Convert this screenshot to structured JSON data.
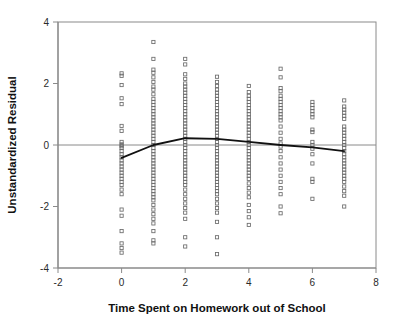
{
  "chart_data": {
    "type": "scatter",
    "title": "",
    "xlabel": "Time Spent on Homework out of School",
    "ylabel": "Unstandardized Residual",
    "xlim": [
      -2,
      8
    ],
    "ylim": [
      -4,
      4
    ],
    "xticks": [
      -2,
      0,
      2,
      4,
      6,
      8
    ],
    "yticks": [
      -4,
      -2,
      0,
      2,
      4
    ],
    "xtick_labels": [
      "-2",
      "0",
      "2",
      "4",
      "6",
      "8"
    ],
    "ytick_labels": [
      "-4",
      "-2",
      "0",
      "2",
      "4"
    ],
    "grid": false,
    "legend": null,
    "marker": "open-square",
    "marker_color": "#666666",
    "reference_line_y": 0,
    "trend_line": {
      "name": "fit line",
      "color": "#111111",
      "x": [
        0,
        1,
        2,
        3,
        4,
        5,
        6,
        7
      ],
      "y": [
        -0.42,
        0.0,
        0.22,
        0.2,
        0.1,
        0.0,
        -0.08,
        -0.2
      ]
    },
    "series": [
      {
        "name": "Unstandardized Residual",
        "x_categories": [
          0,
          1,
          2,
          3,
          4,
          5,
          6,
          7
        ],
        "points_by_x": {
          "0": [
            2.33,
            2.25,
            1.95,
            1.52,
            1.33,
            0.62,
            0.46,
            0.1,
            0.02,
            -0.04,
            -0.1,
            -0.2,
            -0.3,
            -0.4,
            -0.5,
            -0.6,
            -0.7,
            -0.8,
            -0.9,
            -1.0,
            -1.1,
            -1.2,
            -1.3,
            -1.45,
            -1.6,
            -2.1,
            -2.3,
            -2.8,
            -3.2,
            -3.35,
            -3.5
          ],
          "1": [
            3.35,
            2.8,
            2.45,
            2.35,
            2.2,
            2.05,
            1.9,
            1.8,
            1.65,
            1.5,
            1.4,
            1.3,
            1.2,
            1.1,
            1.0,
            0.9,
            0.8,
            0.7,
            0.6,
            0.5,
            0.4,
            0.3,
            0.2,
            0.1,
            0.0,
            -0.1,
            -0.2,
            -0.3,
            -0.4,
            -0.5,
            -0.6,
            -0.7,
            -0.8,
            -0.9,
            -1.0,
            -1.1,
            -1.2,
            -1.3,
            -1.4,
            -1.5,
            -1.6,
            -1.7,
            -1.8,
            -1.95,
            -2.1,
            -2.25,
            -2.4,
            -2.55,
            -2.8,
            -3.1,
            -3.2
          ],
          "2": [
            2.8,
            2.62,
            2.3,
            2.15,
            2.0,
            1.9,
            1.8,
            1.7,
            1.6,
            1.5,
            1.4,
            1.3,
            1.2,
            1.1,
            1.0,
            0.9,
            0.8,
            0.7,
            0.6,
            0.5,
            0.4,
            0.3,
            0.2,
            0.1,
            0.0,
            -0.1,
            -0.2,
            -0.3,
            -0.4,
            -0.5,
            -0.6,
            -0.7,
            -0.8,
            -0.9,
            -1.0,
            -1.1,
            -1.2,
            -1.3,
            -1.45,
            -1.6,
            -1.75,
            -1.9,
            -2.05,
            -2.2,
            -2.4,
            -3.0,
            -3.3
          ],
          "3": [
            2.22,
            2.05,
            1.92,
            1.8,
            1.7,
            1.6,
            1.5,
            1.4,
            1.3,
            1.2,
            1.1,
            1.0,
            0.9,
            0.8,
            0.7,
            0.6,
            0.5,
            0.4,
            0.3,
            0.2,
            0.1,
            0.0,
            -0.1,
            -0.2,
            -0.3,
            -0.4,
            -0.5,
            -0.6,
            -0.7,
            -0.8,
            -0.9,
            -1.0,
            -1.1,
            -1.2,
            -1.3,
            -1.4,
            -1.5,
            -1.6,
            -1.75,
            -1.9,
            -2.05,
            -2.2,
            -2.5,
            -3.0,
            -3.55
          ],
          "4": [
            1.92,
            1.72,
            1.6,
            1.5,
            1.4,
            1.3,
            1.2,
            1.1,
            1.0,
            0.9,
            0.8,
            0.7,
            0.6,
            0.5,
            0.4,
            0.3,
            0.2,
            0.1,
            0.0,
            -0.1,
            -0.2,
            -0.3,
            -0.4,
            -0.5,
            -0.6,
            -0.7,
            -0.8,
            -0.9,
            -1.0,
            -1.1,
            -1.25,
            -1.4,
            -1.55,
            -1.7,
            -1.95,
            -2.15,
            -2.35,
            -2.6
          ],
          "5": [
            2.48,
            2.2,
            1.85,
            1.75,
            1.6,
            1.5,
            1.4,
            1.3,
            1.2,
            1.1,
            1.0,
            0.9,
            0.8,
            0.6,
            0.4,
            0.2,
            0.05,
            -0.05,
            -0.2,
            -0.4,
            -0.6,
            -0.8,
            -1.0,
            -1.2,
            -1.4,
            -1.6,
            -2.0,
            -2.22
          ],
          "6": [
            1.4,
            1.3,
            1.2,
            1.1,
            1.0,
            0.9,
            0.5,
            0.42,
            0.1,
            0.0,
            -0.12,
            -0.3,
            -0.6,
            -1.1,
            -1.2,
            -1.75
          ],
          "7": [
            1.45,
            1.25,
            1.15,
            1.05,
            0.95,
            0.85,
            0.6,
            0.5,
            0.4,
            0.3,
            0.2,
            0.1,
            0.0,
            -0.1,
            -0.2,
            -0.3,
            -0.4,
            -0.5,
            -0.6,
            -0.7,
            -0.8,
            -0.9,
            -1.0,
            -1.1,
            -1.2,
            -1.35,
            -1.5,
            -1.65,
            -2.0
          ]
        }
      }
    ]
  },
  "colors": {
    "axis": "#8a8a8a",
    "marker": "#6b6b6b",
    "trend": "#151515",
    "text": "#1a1a1a"
  }
}
